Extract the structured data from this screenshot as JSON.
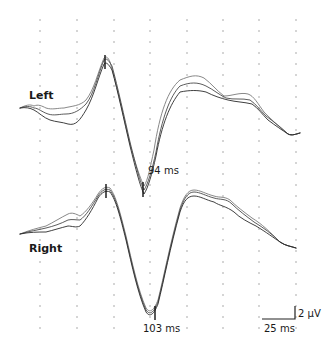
{
  "chart_data": {
    "type": "line",
    "title": "",
    "xlabel": "",
    "ylabel": "",
    "grid": "dotted",
    "series_groups": [
      {
        "name": "Left",
        "peak_label": "94 ms",
        "trace_count": 3,
        "x_ms": [
          0,
          25,
          50,
          75,
          94,
          100,
          125,
          150,
          175,
          200
        ],
        "values_uV": [
          [
            0.0,
            -0.8,
            0.2,
            5.0,
            -7.5,
            -6.0,
            2.5,
            0.5,
            0.0,
            -2.8
          ],
          [
            0.0,
            -1.3,
            -0.4,
            4.4,
            -8.1,
            -6.6,
            2.0,
            0.3,
            -0.5,
            -2.8
          ],
          [
            0.0,
            -1.9,
            -1.0,
            3.8,
            -8.6,
            -7.2,
            1.4,
            0.0,
            -0.9,
            -2.8
          ]
        ]
      },
      {
        "name": "Right",
        "peak_label": "103 ms",
        "trace_count": 3,
        "x_ms": [
          0,
          25,
          50,
          75,
          103,
          125,
          150,
          175,
          200
        ],
        "values_uV": [
          [
            0.0,
            1.0,
            2.2,
            4.6,
            -10.5,
            4.4,
            2.7,
            0.0,
            -1.9
          ],
          [
            0.0,
            0.6,
            1.6,
            4.2,
            -10.8,
            4.0,
            2.2,
            -0.3,
            -1.9
          ],
          [
            0.0,
            0.2,
            0.9,
            3.8,
            -11.1,
            3.6,
            1.6,
            -0.7,
            -1.9
          ]
        ]
      }
    ],
    "annotations": [
      "Left",
      "Right",
      "94 ms",
      "103 ms"
    ],
    "scale_bar": {
      "time": "25 ms",
      "amplitude": "2 µV"
    },
    "grid_columns_ms": [
      0,
      25,
      50,
      75,
      100,
      125,
      150,
      175
    ]
  },
  "labels": {
    "left": "Left",
    "right": "Right",
    "left_peak": "94 ms",
    "right_peak": "103 ms",
    "scale_time": "25 ms",
    "scale_amp": "2 µV"
  },
  "colors": {
    "trace_dark": "#2a2a2a",
    "trace_mid": "#555555",
    "trace_light": "#7a7a7a",
    "grid_dot": "#8a8a8a"
  }
}
